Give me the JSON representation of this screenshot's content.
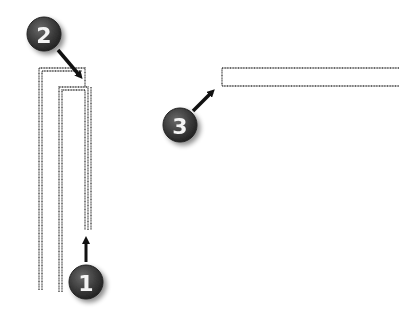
{
  "diagram": {
    "callouts": [
      {
        "id": 1,
        "label": "1",
        "cx": 86,
        "cy": 282
      },
      {
        "id": 2,
        "label": "2",
        "cx": 44,
        "cy": 34
      },
      {
        "id": 3,
        "label": "3",
        "cx": 180,
        "cy": 125
      }
    ],
    "colors": {
      "line": "#3a3a3a",
      "badge": "#3c3c3c",
      "badge_text": "#f4f4f4",
      "arrow": "#111111"
    }
  }
}
